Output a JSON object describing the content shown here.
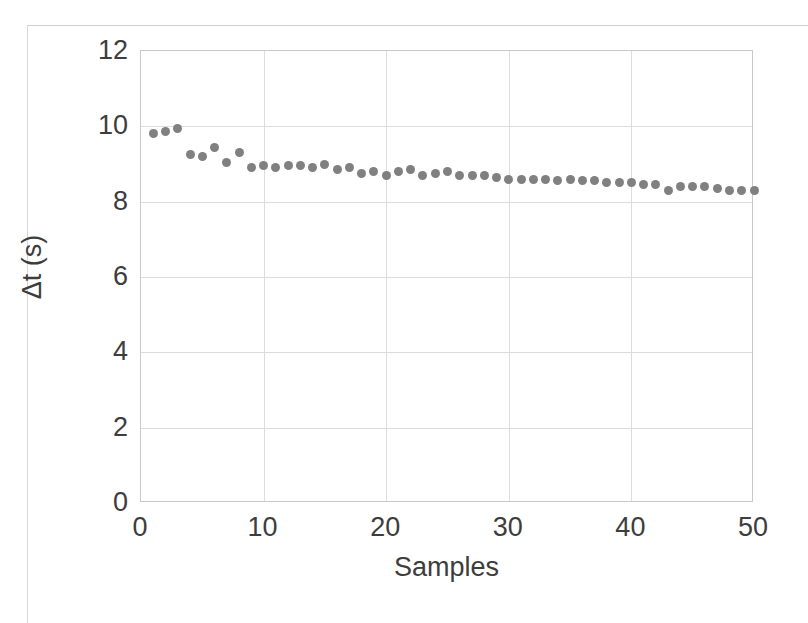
{
  "chart_data": {
    "type": "scatter",
    "title": "",
    "xlabel": "Samples",
    "ylabel": "Δt (s)",
    "xlim": [
      0,
      50
    ],
    "ylim": [
      0,
      12
    ],
    "xticks": [
      0,
      10,
      20,
      30,
      40,
      50
    ],
    "yticks": [
      0,
      2,
      4,
      6,
      8,
      10,
      12
    ],
    "grid": true,
    "legend": "none",
    "marker": {
      "shape": "circle",
      "color": "#808080",
      "size_px": 9
    },
    "series": [
      {
        "name": "Δt",
        "x": [
          1,
          2,
          3,
          4,
          5,
          6,
          7,
          8,
          9,
          10,
          11,
          12,
          13,
          14,
          15,
          16,
          17,
          18,
          19,
          20,
          21,
          22,
          23,
          24,
          25,
          26,
          27,
          28,
          29,
          30,
          31,
          32,
          33,
          34,
          35,
          36,
          37,
          38,
          39,
          40,
          41,
          42,
          43,
          44,
          45,
          46,
          47,
          48,
          49,
          50
        ],
        "values": [
          9.8,
          9.85,
          9.95,
          9.25,
          9.2,
          9.45,
          9.05,
          9.3,
          8.9,
          8.95,
          8.9,
          8.95,
          8.95,
          8.9,
          9.0,
          8.85,
          8.9,
          8.75,
          8.8,
          8.7,
          8.8,
          8.85,
          8.7,
          8.75,
          8.8,
          8.7,
          8.7,
          8.7,
          8.65,
          8.6,
          8.6,
          8.6,
          8.6,
          8.55,
          8.6,
          8.55,
          8.55,
          8.5,
          8.5,
          8.5,
          8.45,
          8.45,
          8.3,
          8.4,
          8.4,
          8.4,
          8.35,
          8.3,
          8.3,
          8.3
        ]
      }
    ]
  },
  "axes": {
    "y_tick_labels": [
      "12",
      "10",
      "8",
      "6",
      "4",
      "2",
      "0"
    ],
    "x_tick_labels": [
      "0",
      "10",
      "20",
      "30",
      "40",
      "50"
    ],
    "x_title": "Samples",
    "y_title": "Δt (s)"
  },
  "colors": {
    "marker": "#808080",
    "grid": "#dcdcdc",
    "frame": "#c9c9c9",
    "text": "#3d3d3d",
    "background": "#ffffff"
  }
}
